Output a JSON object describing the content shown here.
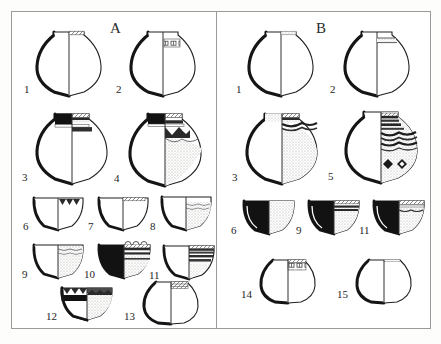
{
  "figure": {
    "type": "archaeological-pottery-typology-plate",
    "caption": "",
    "panels": [
      {
        "id": "A",
        "label": "A",
        "vessels": [
          {
            "num": "1",
            "form": "globular-jar",
            "decoration": "plain body, narrow hatched rim band"
          },
          {
            "num": "2",
            "form": "globular-jar",
            "decoration": "plain body, ladder/rectangle motif band on neck"
          },
          {
            "num": "3",
            "form": "globular-jar",
            "decoration": "solid black rim, hatched and banded shoulder register"
          },
          {
            "num": "4",
            "form": "globular-jar",
            "decoration": "black rim, hatched band, zigzag-triangle frieze, stippled body"
          },
          {
            "num": "6",
            "form": "hemispherical-bowl",
            "decoration": "pendant triangle scallops below rim"
          },
          {
            "num": "7",
            "form": "hemispherical-bowl",
            "decoration": "narrow hatched rim band"
          },
          {
            "num": "8",
            "form": "hemispherical-bowl",
            "decoration": "stippled interior with wavy line band"
          },
          {
            "num": "9",
            "form": "hemispherical-bowl",
            "decoration": "stippled body, wavy rim band"
          },
          {
            "num": "10",
            "form": "hemispherical-bowl",
            "decoration": "black left section, scalloped rim, horizontal bands, stipple"
          },
          {
            "num": "11",
            "form": "hemispherical-bowl",
            "decoration": "horizontal dark bands over stipple"
          },
          {
            "num": "12",
            "form": "hemispherical-bowl",
            "decoration": "triangle frieze at rim, black band, stippled lower body"
          },
          {
            "num": "13",
            "form": "deep-bowl",
            "decoration": "hatched band at rim, plain body"
          }
        ]
      },
      {
        "id": "B",
        "label": "B",
        "vessels": [
          {
            "num": "1",
            "form": "globular-jar",
            "decoration": "plain body, narrow stippled rim band"
          },
          {
            "num": "2",
            "form": "globular-jar",
            "decoration": "plain body, two fine horizontal lines on neck"
          },
          {
            "num": "3",
            "form": "globular-jar",
            "decoration": "stippled body, dark wavy band at shoulder"
          },
          {
            "num": "5",
            "form": "globular-jar",
            "decoration": "banded neck, wavy line registers, lozenge/diamond motifs"
          },
          {
            "num": "6",
            "form": "hemispherical-bowl",
            "decoration": "solid black section, stippled interior"
          },
          {
            "num": "9",
            "form": "hemispherical-bowl",
            "decoration": "solid black section, banded rim, stipple"
          },
          {
            "num": "11",
            "form": "hemispherical-bowl",
            "decoration": "solid black section, hatched band and wavy line"
          },
          {
            "num": "14",
            "form": "deep-bowl",
            "decoration": "ladder/rectangle motif band at rim"
          },
          {
            "num": "15",
            "form": "deep-bowl",
            "decoration": "plain, undecorated"
          }
        ]
      }
    ]
  },
  "colors": {
    "ink": "#1b1b1b",
    "frame": "#9a9a98",
    "paper": "#ffffff",
    "stipple": "#b9b9b5",
    "band": "#3a3a3a"
  }
}
